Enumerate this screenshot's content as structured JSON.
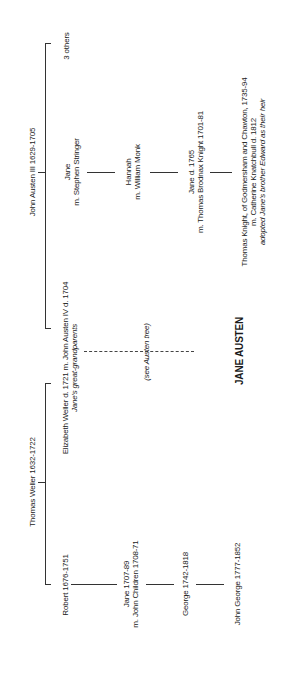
{
  "tree": {
    "austen_side": {
      "patriarch": "John Austen III 1629-1705",
      "others": "3 others",
      "jane_stringer": {
        "name": "Jane",
        "spouse": "m. Stephen Stringer"
      },
      "hannah": {
        "name": "Hannah",
        "spouse": "m. William Monk"
      },
      "jane_knight": {
        "name": "Jane d. 1765",
        "spouse": "m. Thomas Brodnax Knight 1701-81"
      },
      "thomas_knight": {
        "line1": "Thomas Knight, of Godmersham and Chawton, 1735-94",
        "line2": "m. Catherine Knatchbull d. 1812",
        "note": "adopted Jane's brother Edward as their heir"
      }
    },
    "couple": {
      "line": "Elizabeth Weller d. 1721 m. John Austen IV d. 1704",
      "note": "Jane's great-grandparents"
    },
    "see_tree": "(see Austen tree)",
    "subject": "JANE AUSTEN",
    "weller_side": {
      "patriarch": "Thomas Weller 1632-1722",
      "robert": "Robert 1676-1751",
      "jane_children": {
        "name": "Jane 1707-89",
        "spouse": "m. John Children 1708-71"
      },
      "george": "George 1742-1818",
      "john_george": "John George 1777-1852"
    }
  }
}
